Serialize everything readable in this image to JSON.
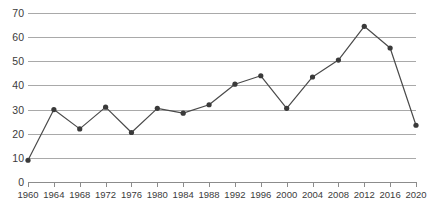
{
  "chart_data": {
    "type": "line",
    "title": "",
    "subtitle": "",
    "xlabel": "",
    "ylabel": "",
    "categories": [
      "1960",
      "1964",
      "1968",
      "1972",
      "1976",
      "1980",
      "1984",
      "1988",
      "1992",
      "1996",
      "2000",
      "2004",
      "2008",
      "2012",
      "2016",
      "2020"
    ],
    "values": [
      9,
      30,
      22,
      31,
      20.5,
      30.5,
      28.5,
      32,
      40.5,
      44,
      30.5,
      43.5,
      50.5,
      64.5,
      55.5,
      23.5
    ],
    "series": [
      {
        "name": "series-1",
        "values": [
          9,
          30,
          22,
          31,
          20.5,
          30.5,
          28.5,
          32,
          40.5,
          44,
          30.5,
          43.5,
          50.5,
          64.5,
          55.5,
          23.5
        ]
      }
    ],
    "ylim": [
      0,
      70
    ],
    "yticks": [
      0,
      10,
      20,
      30,
      40,
      50,
      60,
      70
    ],
    "ytick_labels": [
      "0",
      "10",
      "20",
      "30",
      "40",
      "50",
      "60",
      "70"
    ],
    "xticks": [
      "1960",
      "1964",
      "1968",
      "1972",
      "1976",
      "1980",
      "1984",
      "1988",
      "1992",
      "1996",
      "2000",
      "2004",
      "2008",
      "2012",
      "2016",
      "2020"
    ],
    "grid": true,
    "grid_axis": "y",
    "legend": false,
    "legend_position": "none",
    "markers": "circle",
    "colors": {
      "line": "#4a4a4a",
      "marker": "#3a3a3a",
      "gridline": "#a9a9a9",
      "axis": "#8c8c8c",
      "text": "#3b3b3b",
      "background": "#ffffff"
    },
    "annotations": []
  }
}
